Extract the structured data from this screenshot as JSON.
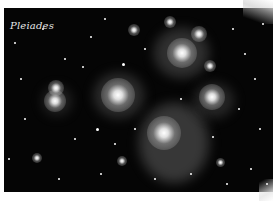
{
  "image": {
    "caption": "Pleiades",
    "subject": "star-cluster-photo",
    "colors": {
      "sky": "#050505",
      "star": "#ffffff",
      "nebula": "#9a9a9a",
      "border": "#ffffff",
      "caption": "#e8e8e8"
    }
  }
}
